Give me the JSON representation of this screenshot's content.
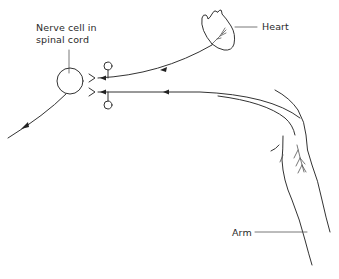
{
  "diagram": {
    "type": "nerve-pathway-illustration",
    "labels": {
      "nerve_cell_line1": "Nerve cell in",
      "nerve_cell_line2": "spinal cord",
      "heart": "Heart",
      "arm": "Arm"
    },
    "elements": [
      {
        "id": "nerve-cell",
        "shape": "circle",
        "description": "Nerve cell body in spinal cord"
      },
      {
        "id": "heart",
        "shape": "heart-drawing",
        "description": "Heart organ with nerve endings"
      },
      {
        "id": "arm",
        "shape": "arm-outline",
        "description": "Arm outline with nerve endings"
      },
      {
        "id": "heart-afferent",
        "shape": "arrow-line",
        "direction": "heart to spinal cord"
      },
      {
        "id": "arm-afferent",
        "shape": "arrow-line",
        "direction": "arm to spinal cord"
      },
      {
        "id": "efferent",
        "shape": "arrow-line",
        "direction": "spinal cord outward"
      },
      {
        "id": "ganglion-upper",
        "shape": "small-circle"
      },
      {
        "id": "ganglion-lower",
        "shape": "small-circle"
      },
      {
        "id": "synapse-upper",
        "shape": "fork"
      },
      {
        "id": "synapse-lower",
        "shape": "fork"
      }
    ],
    "colors": {
      "line": "#333333",
      "text": "#2a2a2a",
      "background": "#ffffff"
    }
  }
}
